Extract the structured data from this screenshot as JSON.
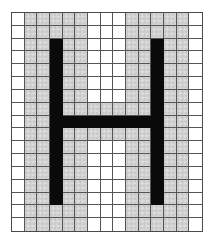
{
  "figure": {
    "letter": "H",
    "grid": {
      "columns": 15,
      "rows": 17
    },
    "colors": {
      "background": "#ffffff",
      "gray_fill": "#d3d3d3",
      "letter_fill": "#0a0a0a",
      "grid_line": "#555555"
    },
    "legend": {
      "w": "white cell",
      "g": "gray shaded cell",
      "b": "black letter stroke cell"
    },
    "cells": [
      "wgggggwwwgggggw",
      "wgggggwwwgggggw",
      "wggbggwwwggbggw",
      "wggbggwwwggbggw",
      "wggbggwwwggbggw",
      "wggbggwwwggbggw",
      "wggbggwwwggbggw",
      "wggbgggggggbggw",
      "wggbbbbbbbbbggw",
      "wggbgggggggbggw",
      "wggbggwwwggbggw",
      "wggbggwwwggbggw",
      "wggbggwwwggbggw",
      "wggbggwwwggbggw",
      "wggbggwwwggbggw",
      "wgggggwwwgggggw",
      "wgggggwwwgggggw"
    ]
  }
}
